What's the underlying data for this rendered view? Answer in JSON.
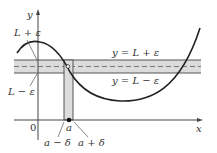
{
  "diagram": {
    "axes": {
      "x_label": "x",
      "y_label": "y",
      "origin_label": "0"
    },
    "labels": {
      "L_plus_eps": "L + ε",
      "L_minus_eps": "L − ε",
      "line_upper": "y = L + ε",
      "line_lower": "y = L − ε",
      "a": "a",
      "a_minus_delta": "a − δ",
      "a_plus_delta": "a + δ"
    },
    "colors": {
      "band_fill": "#dcdcdc",
      "band_border": "#555555",
      "curve": "#222222",
      "axis": "#444444",
      "dashed_line": "#777777"
    }
  }
}
